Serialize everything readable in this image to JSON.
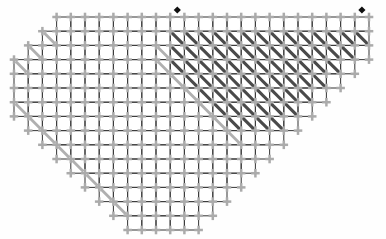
{
  "document": {
    "title": "Stitch Chart",
    "type": "grid-chart",
    "background_color": "#fefefe"
  },
  "chart_data": {
    "type": "heatmap",
    "title": "",
    "xlabel": "",
    "ylabel": "",
    "grid": true,
    "legend_position": "none",
    "cell_size": 14.2,
    "origin": {
      "x": 14,
      "y": 17
    },
    "columns": 25,
    "rows": 15,
    "colors": {
      "grid_line": "#3c3c3c",
      "cross_symbol": "#ababab",
      "dark_hatch": "#4a4a4a",
      "light_hatch": "#b0b0b0",
      "marker": "#101010",
      "paper": "#fefefe"
    },
    "symbols": [
      {
        "name": "cross-stitch",
        "glyph": "plus",
        "color": "#ababab"
      },
      {
        "name": "dark-diagonal",
        "glyph": "backslash-bold",
        "color": "#4a4a4a"
      },
      {
        "name": "light-diagonal",
        "glyph": "backslash-light",
        "color": "#b0b0b0"
      },
      {
        "name": "marker-diamond",
        "glyph": "diamond",
        "color": "#101010"
      }
    ],
    "markers": [
      {
        "label": "marker-left",
        "col": 11,
        "row": 0
      },
      {
        "label": "marker-right",
        "col": 24,
        "row": 0
      }
    ],
    "row_extents": [
      {
        "row": 0,
        "start": 3,
        "end": 10,
        "wing_start": 11,
        "wing_end": 24
      },
      {
        "row": 1,
        "start": 2,
        "end": 24
      },
      {
        "row": 2,
        "start": 1,
        "end": 24
      },
      {
        "row": 3,
        "start": 0,
        "end": 23
      },
      {
        "row": 4,
        "start": 0,
        "end": 22
      },
      {
        "row": 5,
        "start": 0,
        "end": 21
      },
      {
        "row": 6,
        "start": 0,
        "end": 20
      },
      {
        "row": 7,
        "start": 1,
        "end": 19
      },
      {
        "row": 8,
        "start": 2,
        "end": 18
      },
      {
        "row": 9,
        "start": 3,
        "end": 17
      },
      {
        "row": 10,
        "start": 4,
        "end": 16
      },
      {
        "row": 11,
        "start": 5,
        "end": 15
      },
      {
        "row": 12,
        "start": 6,
        "end": 14
      },
      {
        "row": 13,
        "start": 7,
        "end": 13
      },
      {
        "row": 14,
        "start": 8,
        "end": 12
      }
    ],
    "dark_hatch_cells": [
      {
        "row": 1,
        "start": 11,
        "end": 24
      },
      {
        "row": 2,
        "start": 11,
        "end": 23
      },
      {
        "row": 3,
        "start": 11,
        "end": 22
      },
      {
        "row": 4,
        "start": 12,
        "end": 21
      },
      {
        "row": 5,
        "start": 13,
        "end": 20
      },
      {
        "row": 6,
        "start": 14,
        "end": 19
      },
      {
        "row": 7,
        "start": 15,
        "end": 18
      }
    ],
    "light_hatch_cells": [
      {
        "row": 1,
        "col": 2
      },
      {
        "row": 2,
        "col": 1
      },
      {
        "row": 3,
        "col": 0
      },
      {
        "row": 6,
        "col": 0
      },
      {
        "row": 7,
        "col": 1
      },
      {
        "row": 8,
        "col": 2
      },
      {
        "row": 9,
        "col": 3
      },
      {
        "row": 10,
        "col": 4
      },
      {
        "row": 11,
        "col": 5
      },
      {
        "row": 12,
        "col": 6
      },
      {
        "row": 13,
        "col": 7
      },
      {
        "row": 2,
        "col": 10
      },
      {
        "row": 3,
        "col": 10
      },
      {
        "row": 4,
        "col": 11
      },
      {
        "row": 5,
        "col": 12
      },
      {
        "row": 6,
        "col": 13
      },
      {
        "row": 7,
        "col": 14
      },
      {
        "row": 8,
        "col": 15
      }
    ]
  }
}
